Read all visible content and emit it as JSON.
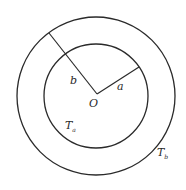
{
  "diagram": {
    "center": {
      "x": 96,
      "y": 96,
      "label": "O"
    },
    "outer_circle": {
      "r": 79,
      "region_label": "T",
      "region_subscript": "b"
    },
    "inner_circle": {
      "r": 52,
      "region_label": "T",
      "region_subscript": "a"
    },
    "radius_lines": [
      {
        "name": "b",
        "label": "b",
        "x2": 49,
        "y2": 33
      },
      {
        "name": "a",
        "label": "a",
        "x2": 139,
        "y2": 67
      }
    ],
    "stroke_color": "#2a2a2a",
    "background": "#ffffff"
  }
}
